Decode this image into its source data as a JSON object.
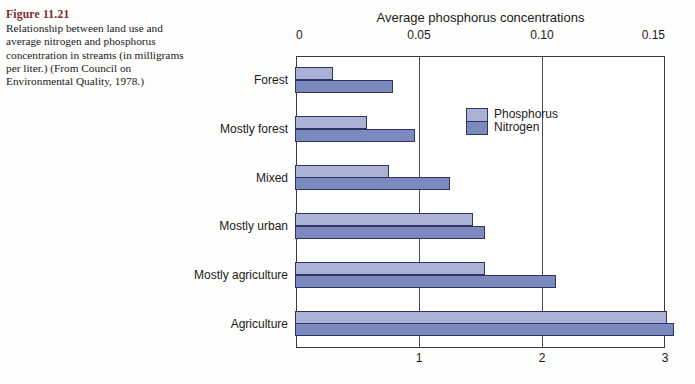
{
  "caption": {
    "figure_label": "Figure 11.21",
    "text": "Relationship between land use and average nitrogen and phosphorus concentration in streams (in milligrams per liter.) (From Council on Environmental Quality, 1978.)"
  },
  "legend": {
    "phosphorus_label": "Phosphorus",
    "nitrogen_label": "Nitrogen",
    "phosphorus_color": "#a9b1d6",
    "nitrogen_color": "#7c89bf",
    "outline_color": "#2f3560"
  },
  "chart_data": {
    "type": "bar",
    "orientation": "horizontal",
    "title": "Average phosphorus concentrations",
    "xlabel": "",
    "ylabel": "",
    "grid": true,
    "legend_position": "inside-upper-right",
    "categories": [
      "Forest",
      "Mostly forest",
      "Mixed",
      "Mostly urban",
      "Mostly agriculture",
      "Agriculture"
    ],
    "series": [
      {
        "name": "Phosphorus",
        "axis": "top",
        "unit": "mg/L",
        "values": [
          0.015,
          0.029,
          0.038,
          0.072,
          0.077,
          0.151
        ]
      },
      {
        "name": "Nitrogen",
        "axis": "bottom",
        "unit": "mg/L",
        "values": [
          0.79,
          0.97,
          1.25,
          1.54,
          2.11,
          3.07
        ]
      }
    ],
    "axes": {
      "top": {
        "label": "Average phosphorus concentrations",
        "ticks": [
          "0",
          "0.05",
          "0.10",
          "0.15"
        ],
        "tick_values": [
          0,
          0.05,
          0.1,
          0.15
        ],
        "range": [
          0,
          0.15
        ]
      },
      "bottom": {
        "label": "",
        "ticks": [
          "1",
          "2",
          "3"
        ],
        "tick_values": [
          1,
          2,
          3
        ],
        "range": [
          0,
          3
        ]
      }
    }
  }
}
